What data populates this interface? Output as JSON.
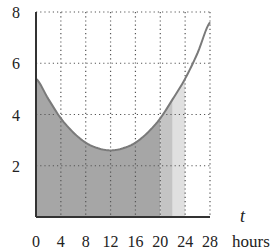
{
  "chart_data": {
    "type": "area",
    "title": "",
    "xlabel": "t",
    "xlabel_unit": "hours",
    "ylabel": "",
    "xlim": [
      0,
      28
    ],
    "ylim": [
      0,
      8
    ],
    "x_ticks": [
      0,
      4,
      8,
      12,
      16,
      20,
      24,
      28
    ],
    "y_ticks": [
      2,
      4,
      6,
      8
    ],
    "x_tick_labels": [
      "0",
      "4",
      "8",
      "12",
      "16",
      "20",
      "24",
      "28"
    ],
    "y_tick_labels": [
      "2",
      "4",
      "6",
      "8"
    ],
    "grid": true,
    "grid_style": "dotted",
    "curve": {
      "x": [
        0,
        2,
        4,
        6,
        8,
        10,
        12,
        14,
        16,
        18,
        20,
        22,
        24,
        26,
        28
      ],
      "y": [
        5.4,
        4.6,
        3.85,
        3.3,
        2.9,
        2.68,
        2.6,
        2.68,
        2.9,
        3.3,
        3.85,
        4.6,
        5.4,
        6.4,
        7.6
      ]
    },
    "shaded_regions": [
      {
        "from": 0,
        "to": 20,
        "color": "#a6a6a6"
      },
      {
        "from": 20,
        "to": 22,
        "color": "#c4c4c4"
      },
      {
        "from": 22,
        "to": 24,
        "color": "#e0e0e0"
      }
    ],
    "curve_color": "#7a7a7a",
    "axis_color": "#333333"
  }
}
